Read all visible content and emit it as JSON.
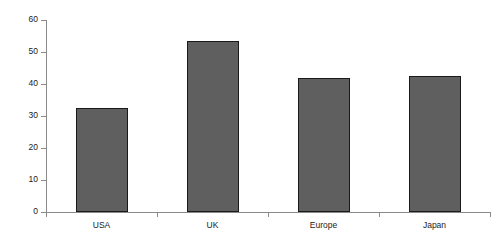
{
  "chart_data": {
    "type": "bar",
    "title": "",
    "subtitle": "",
    "xlabel": "",
    "ylabel": "",
    "categories": [
      "USA",
      "UK",
      "Europe",
      "Japan"
    ],
    "values": [
      32.5,
      53.5,
      42,
      42.5
    ],
    "ylim": [
      0,
      60
    ],
    "y_ticks": [
      0,
      10,
      20,
      30,
      40,
      50,
      60
    ],
    "y_tick_labels": [
      "0",
      "10",
      "20",
      "30",
      "40",
      "50",
      "60"
    ],
    "grid": false,
    "legend": false,
    "legend_position": "none",
    "bar_color": "#5f5f5f",
    "bar_border_color": "#1a1a1a",
    "axis_color": "#8a8a8a",
    "background_color": "#ffffff"
  }
}
